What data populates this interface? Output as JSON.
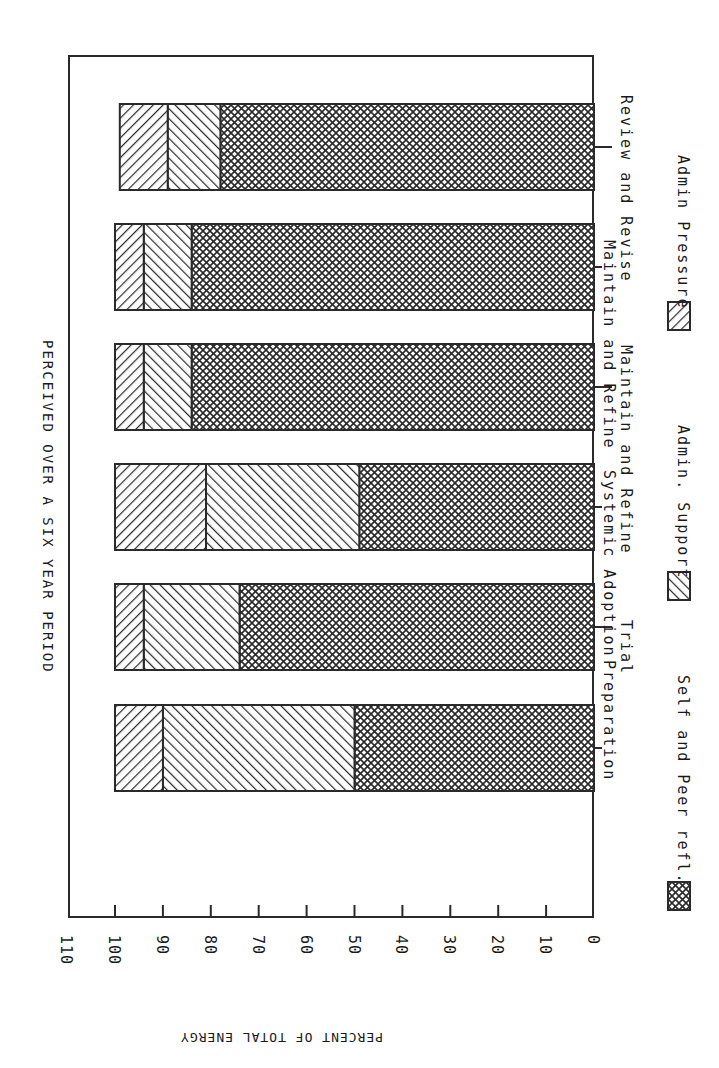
{
  "chart_data": {
    "type": "bar",
    "orientation": "rotated-90-cw (stacked horizontal bars, value axis along bottom edge, 0 at right)",
    "title": "PERCEIVED OVER A SIX YEAR PERIOD",
    "ylabel": "PERCENT OF TOTAL ENERGY",
    "xlabel": "",
    "ylim": [
      0,
      110
    ],
    "y_ticks": [
      0,
      10,
      20,
      30,
      40,
      50,
      60,
      70,
      80,
      90,
      100,
      110
    ],
    "grid": false,
    "stacked": true,
    "categories": [
      "Preparation",
      "Trial",
      "Systemic Adoption",
      "Maintain and Refine",
      "Maintain and Refine",
      "Review and Revise"
    ],
    "series": [
      {
        "name": "Self and Peer refl.",
        "pattern": "crosshatch",
        "values": [
          50,
          74,
          49,
          84,
          84,
          78
        ]
      },
      {
        "name": "Admin. Support",
        "pattern": "forward-diagonal",
        "values": [
          40,
          20,
          32,
          10,
          10,
          11
        ]
      },
      {
        "name": "Admin Pressure",
        "pattern": "back-diagonal",
        "values": [
          10,
          6,
          19,
          6,
          6,
          10
        ]
      }
    ],
    "cumulative_tops": [
      100,
      100,
      100,
      100,
      100,
      99
    ],
    "legend": {
      "position": "bottom (rotated: right edge)",
      "entries": [
        "Self and Peer refl.",
        "Admin. Support",
        "Admin Pressure"
      ]
    }
  },
  "labels": {
    "title": "PERCEIVED OVER A SIX YEAR PERIOD",
    "ylabel": "PERCENT OF TOTAL ENERGY",
    "ticks": [
      "0",
      "10",
      "20",
      "30",
      "40",
      "50",
      "60",
      "70",
      "80",
      "90",
      "100",
      "110"
    ],
    "categories": [
      "Preparation",
      "Trial",
      "Systemic Adoption",
      "Maintain and Refine",
      "Maintain and Refine",
      "Review and Revise"
    ],
    "legend": [
      "Self and Peer refl.",
      "Admin. Support",
      "Admin Pressure"
    ]
  },
  "colors": {
    "ink": "#2a2a2a",
    "background": "#ffffff"
  }
}
